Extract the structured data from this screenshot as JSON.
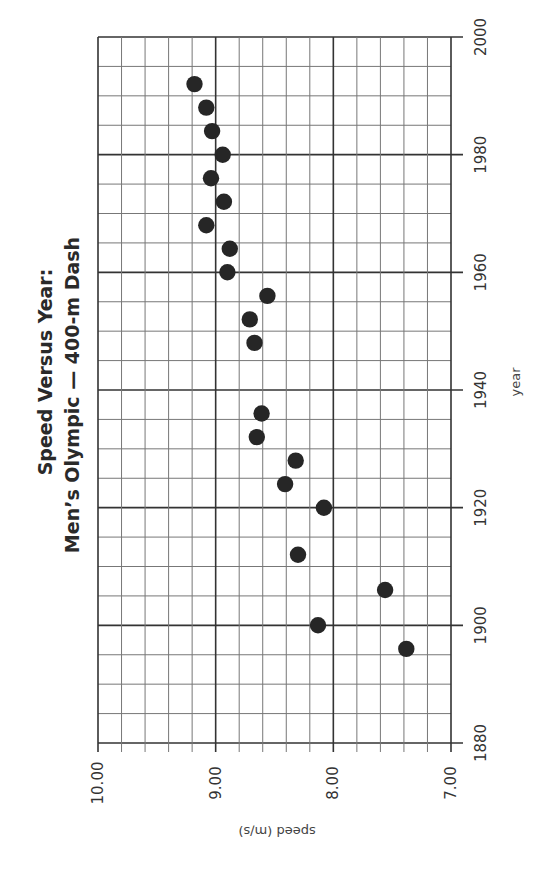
{
  "chart_data": {
    "type": "scatter",
    "title": "Speed Versus Year:",
    "subtitle": "Men’s Olympic — 400-m Dash",
    "xlabel": "year",
    "ylabel": "speed (m/s)",
    "orientation": "rotated-90",
    "x_range": [
      1880,
      2000
    ],
    "y_range": [
      7.0,
      10.0
    ],
    "x_ticks": [
      "1880",
      "1900",
      "1920",
      "1940",
      "1960",
      "1980",
      "2000"
    ],
    "y_ticks": [
      "10.00",
      "9.00",
      "8.00",
      "7.00"
    ],
    "grid": true,
    "x_minor_step": 5,
    "y_minor_step": 0.2,
    "series": [
      {
        "name": "Men's Olympic 400-m Dash",
        "points": [
          {
            "year": 1896,
            "speed": 7.38
          },
          {
            "year": 1900,
            "speed": 8.13
          },
          {
            "year": 1906,
            "speed": 7.56
          },
          {
            "year": 1912,
            "speed": 8.3
          },
          {
            "year": 1920,
            "speed": 8.08
          },
          {
            "year": 1924,
            "speed": 8.41
          },
          {
            "year": 1928,
            "speed": 8.32
          },
          {
            "year": 1932,
            "speed": 8.65
          },
          {
            "year": 1936,
            "speed": 8.61
          },
          {
            "year": 1948,
            "speed": 8.67
          },
          {
            "year": 1952,
            "speed": 8.71
          },
          {
            "year": 1956,
            "speed": 8.56
          },
          {
            "year": 1960,
            "speed": 8.9
          },
          {
            "year": 1964,
            "speed": 8.88
          },
          {
            "year": 1968,
            "speed": 9.08
          },
          {
            "year": 1972,
            "speed": 8.93
          },
          {
            "year": 1976,
            "speed": 9.04
          },
          {
            "year": 1980,
            "speed": 8.94
          },
          {
            "year": 1984,
            "speed": 9.03
          },
          {
            "year": 1988,
            "speed": 9.08
          },
          {
            "year": 1992,
            "speed": 9.18
          }
        ]
      }
    ]
  },
  "header": {
    "title_line1": "Speed Versus Year:",
    "title_line2": "Men’s Olympic — 400-m Dash"
  },
  "axes": {
    "year_label": "year",
    "speed_label": "speed (m/s)"
  },
  "colors": {
    "point": "#262626",
    "grid_minor": "#777777",
    "grid_major": "#333333"
  }
}
